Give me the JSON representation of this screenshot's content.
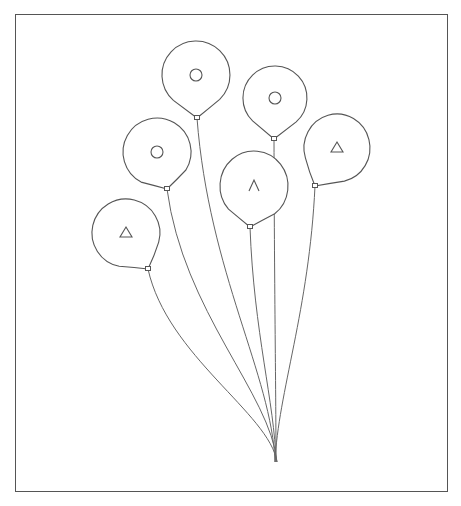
{
  "illustration": {
    "subject": "bunch of balloons",
    "frame": {
      "x": 15,
      "y": 14,
      "width": 433,
      "height": 478,
      "color": "#555555"
    },
    "line_color": "#555555",
    "gather_point": {
      "x": 276,
      "y": 462
    },
    "balloons": [
      {
        "id": "top-center",
        "cx": 196,
        "cy": 75,
        "rx": 34,
        "ry": 34,
        "knot": {
          "x": 197,
          "y": 118
        },
        "mark": "circle"
      },
      {
        "id": "upper-right",
        "cx": 275,
        "cy": 98,
        "rx": 32,
        "ry": 32,
        "knot": {
          "x": 274,
          "y": 139
        },
        "mark": "circle"
      },
      {
        "id": "middle-left",
        "cx": 157,
        "cy": 152,
        "rx": 34,
        "ry": 34,
        "knot": {
          "x": 167,
          "y": 189
        },
        "mark": "circle"
      },
      {
        "id": "far-right",
        "cx": 337,
        "cy": 148,
        "rx": 33,
        "ry": 34,
        "knot": {
          "x": 315,
          "y": 186
        },
        "mark": "triangle"
      },
      {
        "id": "center",
        "cx": 254,
        "cy": 186,
        "rx": 34,
        "ry": 35,
        "knot": {
          "x": 250,
          "y": 227
        },
        "mark": "caret"
      },
      {
        "id": "lower-left",
        "cx": 126,
        "cy": 233,
        "rx": 34,
        "ry": 34,
        "knot": {
          "x": 148,
          "y": 269
        },
        "mark": "triangle"
      }
    ]
  }
}
